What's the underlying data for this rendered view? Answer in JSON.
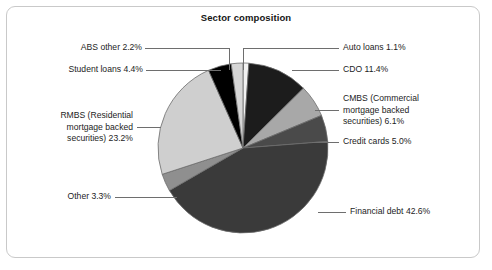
{
  "chart_data": {
    "type": "pie",
    "title": "Sector composition",
    "xlabel": "",
    "ylabel": "",
    "legend_position": "none",
    "labels_position": "outside-callout",
    "categories": [
      "Auto loans",
      "CDO",
      "CMBS (Commercial mortgage backed securities)",
      "Credit cards",
      "Financial debt",
      "Other",
      "RMBS (Residential mortgage backed securities)",
      "Student loans",
      "ABS other"
    ],
    "values": [
      1.1,
      11.4,
      6.1,
      5.0,
      42.6,
      3.3,
      23.2,
      4.4,
      2.2
    ],
    "unit": "%",
    "total": 99.3,
    "slice_colors": [
      "#f2f2f2",
      "#1c1c1c",
      "#a8a8a8",
      "#4a4a4a",
      "#3a3a3a",
      "#8f8f8f",
      "#cfcfcf",
      "#000000",
      "#d6d6d6"
    ],
    "annotations": [
      {
        "text": "Auto loans 1.1%",
        "side": "right"
      },
      {
        "text": "CDO 11.4%",
        "side": "right"
      },
      {
        "text": "CMBS (Commercial\nmortgage backed\nsecurities) 6.1%",
        "side": "right"
      },
      {
        "text": "Credit cards 5.0%",
        "side": "right"
      },
      {
        "text": "Financial debt 42.6%",
        "side": "right"
      },
      {
        "text": "Other 3.3%",
        "side": "left"
      },
      {
        "text": "RMBS (Residential\nmortgage backed\nsecurities) 23.2%",
        "side": "left"
      },
      {
        "text": "Student loans 4.4%",
        "side": "left"
      },
      {
        "text": "ABS other 2.2%",
        "side": "left"
      }
    ]
  },
  "frame": {
    "border_color": "#c9c9c9",
    "background": "#ffffff"
  }
}
